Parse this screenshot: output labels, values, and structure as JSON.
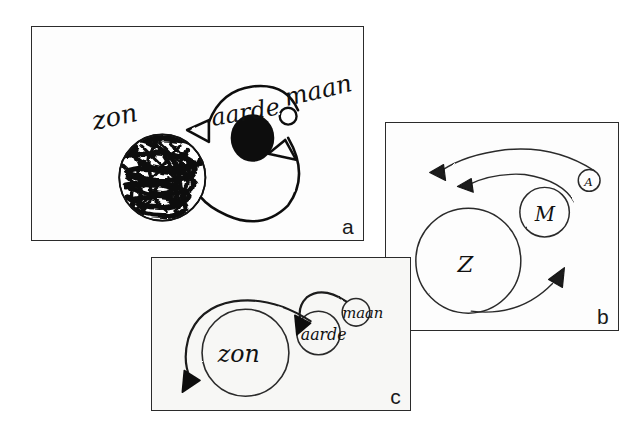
{
  "figure": {
    "caption_language": "Dutch",
    "background_color": "#ffffff",
    "ink_color": "#111111",
    "panels": [
      {
        "id": "a",
        "label": "a",
        "labels": {
          "sun": "zon",
          "earth": "aarde",
          "moon": "maan"
        },
        "bodies": [
          {
            "name": "zon",
            "style": "scribbled-shaded-circle",
            "cx": 131,
            "cy": 152,
            "r": 44
          },
          {
            "name": "aarde",
            "style": "solid-black-circle",
            "cx": 223,
            "cy": 113,
            "r": 22
          },
          {
            "name": "maan",
            "style": "small-open-circle",
            "cx": 258,
            "cy": 92,
            "r": 8
          }
        ],
        "arrows": [
          {
            "name": "orbit-arrow-top",
            "direction": "counter-clockwise",
            "points_to": "zon"
          },
          {
            "name": "orbit-arrow-bottom",
            "direction": "counter-clockwise",
            "points_to": "maan"
          }
        ]
      },
      {
        "id": "b",
        "label": "b",
        "labels": {
          "sun": "Z",
          "moon": "M",
          "earth": "A"
        },
        "bodies": [
          {
            "name": "Z",
            "style": "open-circle-large",
            "cx": 85,
            "cy": 135,
            "r": 53
          },
          {
            "name": "M",
            "style": "open-circle-medium",
            "cx": 158,
            "cy": 88,
            "r": 24
          },
          {
            "name": "A",
            "style": "open-circle-small",
            "cx": 203,
            "cy": 57,
            "r": 11
          }
        ],
        "arrows": [
          {
            "name": "arrow-outer-left",
            "direction": "leftward"
          },
          {
            "name": "arrow-inner-left",
            "direction": "leftward"
          },
          {
            "name": "arrow-lower-right",
            "direction": "rightward-up"
          }
        ]
      },
      {
        "id": "c",
        "label": "c",
        "labels": {
          "sun": "zon",
          "earth": "aarde",
          "moon": "maan"
        },
        "bodies": [
          {
            "name": "zon",
            "style": "open-circle-large",
            "cx": 96,
            "cy": 95,
            "r": 44
          },
          {
            "name": "aarde",
            "style": "open-circle-medium",
            "cx": 169,
            "cy": 76,
            "r": 22
          },
          {
            "name": "maan",
            "style": "open-circle-small",
            "cx": 205,
            "cy": 55,
            "r": 14
          }
        ],
        "arrows": [
          {
            "name": "arrow-to-zon",
            "direction": "leftward-down",
            "points_to": "zon"
          },
          {
            "name": "arrow-to-aarde",
            "direction": "leftward-down",
            "points_to": "aarde"
          }
        ]
      }
    ]
  }
}
